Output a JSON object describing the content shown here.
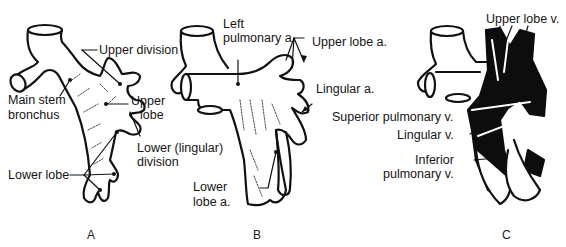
{
  "figure": {
    "panels": [
      {
        "id": "A",
        "letter": "A",
        "subject": "bronchial tree",
        "labels": {
          "upper_division": "Upper division",
          "main_stem_1": "Main stem",
          "main_stem_2": "bronchus",
          "upper_lobe_1": "Upper",
          "upper_lobe_2": "lobe",
          "lower_lingular_1": "Lower (lingular)",
          "lower_lingular_2": "division",
          "lower_lobe": "Lower lobe"
        }
      },
      {
        "id": "B",
        "letter": "B",
        "subject": "pulmonary arteries",
        "labels": {
          "left_pulmonary_1": "Left",
          "left_pulmonary_2": "pulmonary a.",
          "upper_lobe_a": "Upper lobe a.",
          "lingular_a": "Lingular a.",
          "lower_lobe_a_1": "Lower",
          "lower_lobe_a_2": "lobe a."
        }
      },
      {
        "id": "C",
        "letter": "C",
        "subject": "pulmonary veins",
        "labels": {
          "upper_lobe_v": "Upper lobe v.",
          "superior_pulmonary_v": "Superior pulmonary v.",
          "lingular_v": "Lingular v.",
          "inferior_1": "Inferior",
          "inferior_2": "pulmonary v."
        }
      }
    ],
    "colors": {
      "ink": "#111111",
      "background": "#ffffff",
      "vein_fill": "#0d0d0d"
    }
  }
}
